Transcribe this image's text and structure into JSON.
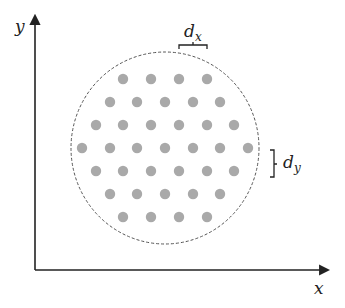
{
  "diagram": {
    "axes": {
      "x_label": "x",
      "y_label": "y",
      "origin": [
        35,
        270
      ],
      "x_end": [
        328,
        270
      ],
      "y_end": [
        35,
        16
      ]
    },
    "boundary": {
      "shape": "dashed-circle",
      "center": [
        165,
        148
      ],
      "rx": 94,
      "ry": 96,
      "stroke": "#555555"
    },
    "grid": {
      "dot_color": "#a9a9a9",
      "dot_radius": 5.2,
      "rows": [
        {
          "y": 79,
          "xs": [
            123,
            151,
            179,
            207
          ]
        },
        {
          "y": 102,
          "xs": [
            110,
            137,
            165,
            193,
            220
          ]
        },
        {
          "y": 125,
          "xs": [
            96,
            123,
            151,
            179,
            207,
            234
          ]
        },
        {
          "y": 148,
          "xs": [
            82,
            110,
            137,
            165,
            193,
            220,
            248
          ]
        },
        {
          "y": 171,
          "xs": [
            96,
            123,
            151,
            179,
            207,
            234
          ]
        },
        {
          "y": 194,
          "xs": [
            110,
            137,
            165,
            193,
            220
          ]
        },
        {
          "y": 217,
          "xs": [
            123,
            151,
            179,
            207
          ]
        }
      ]
    },
    "annotations": {
      "dx_label": "d",
      "dx_sub": "x",
      "dy_label": "d",
      "dy_sub": "y"
    }
  }
}
